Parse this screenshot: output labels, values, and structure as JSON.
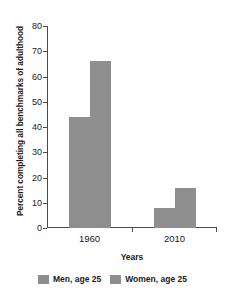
{
  "chart_data": {
    "type": "bar",
    "title": "",
    "xlabel": "Years",
    "ylabel": "Percent completing all benchmarks of adulthood",
    "categories": [
      "1960",
      "2010"
    ],
    "series": [
      {
        "name": "Men, age 25",
        "values": [
          44,
          8
        ]
      },
      {
        "name": "Women, age 25",
        "values": [
          66,
          16
        ]
      }
    ],
    "ylim": [
      0,
      80
    ],
    "yticks": [
      0,
      10,
      20,
      30,
      40,
      50,
      60,
      70,
      80
    ],
    "ytick_labels": [
      "0",
      "10",
      "20",
      "30",
      "40",
      "50",
      "60",
      "70",
      "80"
    ],
    "grid": false,
    "legend_position": "bottom",
    "bar_color": "#8e8e8e",
    "axis_color": "#4a4a4a",
    "text_color": "#1a1a1a"
  }
}
